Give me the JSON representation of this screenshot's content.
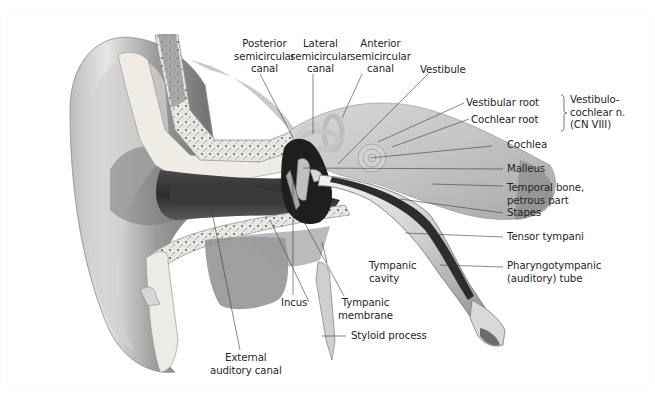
{
  "figure": {
    "labels": {
      "posterior_semicircular_canal": [
        "Posterior",
        "semicircular",
        "canal"
      ],
      "lateral_semicircular_canal": [
        "Lateral",
        "semicircular",
        "canal"
      ],
      "anterior_semicircular_canal": [
        "Anterior",
        "semicircular",
        "canal"
      ],
      "vestibule": "Vestibule",
      "vestibular_root": "Vestibular root",
      "cochlear_root": "Cochlear root",
      "vestibulocochlear_nerve": [
        "Vestibulo-",
        "cochlear n.",
        "(CN VIII)"
      ],
      "cochlea": "Cochlea",
      "malleus": "Malleus",
      "temporal_bone": [
        "Temporal bone,",
        "petrous part"
      ],
      "stapes": "Stapes",
      "tensor_tympani": "Tensor tympani",
      "pharyngotympanic_tube": [
        "Pharyngotympanic",
        "(auditory) tube"
      ],
      "tympanic_cavity": [
        "Tympanic",
        "cavity"
      ],
      "incus": "Incus",
      "tympanic_membrane": [
        "Tympanic",
        "membrane"
      ],
      "styloid_process": "Styloid process",
      "external_auditory_canal": [
        "External",
        "auditory canal"
      ]
    },
    "colors": {
      "label_text": "#1f1f1f",
      "leader_line": "#3a3a3a",
      "background": "#ffffff"
    }
  }
}
